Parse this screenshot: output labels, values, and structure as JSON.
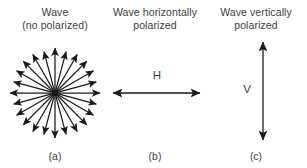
{
  "figure": {
    "background_color": "#ffffff",
    "stroke_color": "#1a1a1a",
    "text_color": "#3d3d3d"
  },
  "panels": [
    {
      "id": "a",
      "heading_line1": "Wave",
      "heading_line2": "(no polarized)",
      "caption": "(a)",
      "diagram": "radial-starburst",
      "ray_count": 24,
      "ray_angle_step_deg": 15,
      "center": {
        "x": 55,
        "y": 93
      },
      "radius": 45,
      "axis_label": ""
    },
    {
      "id": "b",
      "heading_line1": "Wave horizontally",
      "heading_line2": "polarized",
      "caption": "(b)",
      "diagram": "horizontal-double-arrow",
      "axis_label": "H",
      "arrow_start": {
        "x": 113,
        "y": 93
      },
      "arrow_end": {
        "x": 200,
        "y": 93
      }
    },
    {
      "id": "c",
      "heading_line1": "Wave vertically",
      "heading_line2": "polarized",
      "caption": "(c)",
      "diagram": "vertical-double-arrow",
      "axis_label": "V",
      "arrow_start": {
        "x": 263,
        "y": 42
      },
      "arrow_end": {
        "x": 263,
        "y": 140
      }
    }
  ]
}
